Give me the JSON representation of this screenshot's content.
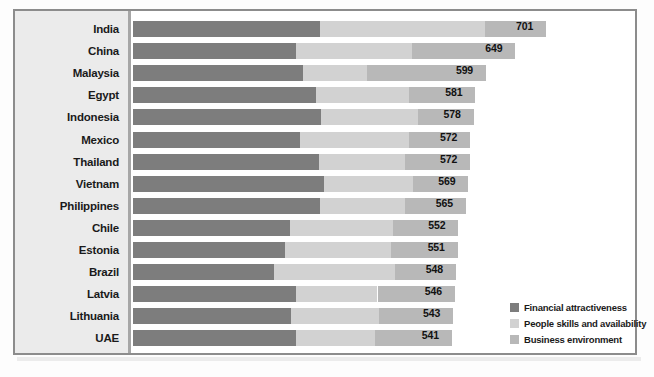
{
  "chart_data": {
    "type": "bar",
    "orientation": "horizontal",
    "stacked": true,
    "title": "",
    "subtitle": "",
    "xlabel": "",
    "ylabel": "",
    "grid": false,
    "legend_position": "bottom-right",
    "xlim": [
      0,
      760
    ],
    "categories": [
      "India",
      "China",
      "Malaysia",
      "Egypt",
      "Indonesia",
      "Mexico",
      "Thailand",
      "Vietnam",
      "Philippines",
      "Chile",
      "Estonia",
      "Brazil",
      "Latvia",
      "Lithuania",
      "UAE"
    ],
    "series": [
      {
        "name": "Financial attractiveness",
        "color": "#7d7d7d",
        "values": [
          318,
          276,
          289,
          311,
          319,
          283,
          316,
          324,
          318,
          267,
          258,
          240,
          276,
          269,
          276
        ]
      },
      {
        "name": "People skills and availability",
        "color": "#d2d2d2",
        "values": [
          279,
          197,
          108,
          157,
          165,
          186,
          146,
          152,
          144,
          175,
          180,
          204,
          139,
          148,
          134
        ]
      },
      {
        "name": "Business environment",
        "color": "#b8b8b8",
        "values": [
          104,
          176,
          202,
          113,
          94,
          103,
          110,
          93,
          103,
          110,
          113,
          104,
          131,
          126,
          131
        ]
      }
    ],
    "totals": [
      701,
      649,
      599,
      581,
      578,
      572,
      572,
      569,
      565,
      552,
      551,
      548,
      546,
      543,
      541
    ],
    "value_labels": [
      "701",
      "649",
      "599",
      "581",
      "578",
      "572",
      "572",
      "569",
      "565",
      "552",
      "551",
      "548",
      "546",
      "543",
      "541"
    ]
  },
  "legend": {
    "items": [
      {
        "label": "Financial attractiveness",
        "color": "#7d7d7d"
      },
      {
        "label": "People skills and availability",
        "color": "#d2d2d2"
      },
      {
        "label": "Business environment",
        "color": "#b8b8b8"
      }
    ]
  },
  "colors": {
    "financial": "#7d7d7d",
    "people": "#d2d2d2",
    "business": "#b8b8b8",
    "frame_border": "#8c8c8c",
    "label_column_bg": "#ebebeb",
    "axis_line": "#a6a6a6",
    "text": "#1a1a1a",
    "plot_bg": "#ffffff"
  }
}
